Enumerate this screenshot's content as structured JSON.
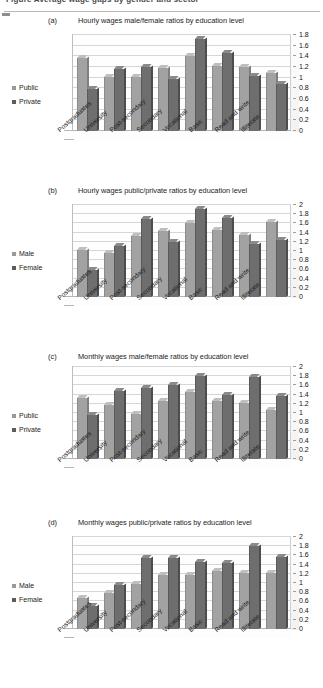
{
  "header": {
    "clipped_caption": "Figure  Average wage gaps by gender and sector"
  },
  "categories": [
    "Postgraduates",
    "University",
    "Post-secondary",
    "Secondary",
    "Vocational",
    "Basic",
    "Read and write",
    "Illiterate"
  ],
  "colors": {
    "series1": "#a2a2a2",
    "series2": "#6e6e6e",
    "gridline": "#d6d6d6",
    "axis": "#bdbdbd"
  },
  "panels": [
    {
      "letter": "(a)",
      "title": "Hourly wages male/female ratios by education level",
      "legend": [
        "Public",
        "Private"
      ],
      "yticks": [
        "1.8",
        "1.6",
        "1.4",
        "1.2",
        "1",
        "0.8",
        "0.6",
        "0.4",
        "0.2",
        "0"
      ]
    },
    {
      "letter": "(b)",
      "title": "Hourly wages public/private ratios by education level",
      "legend": [
        "Male",
        "Female"
      ],
      "yticks": [
        "2",
        "1.8",
        "1.6",
        "1.4",
        "1.2",
        "1",
        "0.8",
        "0.6",
        "0.4",
        "0.2",
        "0"
      ]
    },
    {
      "letter": "(c)",
      "title": "Monthly wages male/female ratios by education level",
      "legend": [
        "Public",
        "Private"
      ],
      "yticks": [
        "2",
        "1.8",
        "1.6",
        "1.4",
        "1.2",
        "1",
        "0.8",
        "0.6",
        "0.4",
        "0.2",
        "0"
      ]
    },
    {
      "letter": "(d)",
      "title": "Monthly wages public/private ratios by education level",
      "legend": [
        "Male",
        "Female"
      ],
      "yticks": [
        "2",
        "1.8",
        "1.6",
        "1.4",
        "1.2",
        "1",
        "0.8",
        "0.6",
        "0.4",
        "0.2",
        "0"
      ]
    }
  ],
  "chart_data": [
    {
      "type": "bar",
      "title": "Hourly wages male/female ratios by education level",
      "panel": "(a)",
      "xlabel": "",
      "ylabel": "",
      "ylim": [
        0,
        1.8
      ],
      "ytick_step": 0.2,
      "grid": true,
      "legend_position": "left",
      "categories": [
        "Postgraduates",
        "University",
        "Post-secondary",
        "Secondary",
        "Vocational",
        "Basic",
        "Read and write",
        "Illiterate"
      ],
      "series": [
        {
          "name": "Public",
          "values": [
            1.42,
            1.07,
            1.06,
            1.23,
            1.47,
            1.27,
            1.25,
            1.15
          ]
        },
        {
          "name": "Private",
          "values": [
            0.85,
            1.21,
            1.26,
            1.04,
            1.78,
            1.52,
            1.08,
            0.93
          ]
        }
      ]
    },
    {
      "type": "bar",
      "title": "Hourly wages public/private ratios by education level",
      "panel": "(b)",
      "xlabel": "",
      "ylabel": "",
      "ylim": [
        0,
        2.0
      ],
      "ytick_step": 0.2,
      "grid": true,
      "legend_position": "left",
      "categories": [
        "Postgraduates",
        "University",
        "Post-secondary",
        "Secondary",
        "Vocational",
        "Basic",
        "Read and write",
        "Illiterate"
      ],
      "series": [
        {
          "name": "Male",
          "values": [
            1.08,
            1.03,
            1.4,
            1.51,
            1.67,
            1.52,
            1.41,
            1.7
          ]
        },
        {
          "name": "Female",
          "values": [
            0.65,
            1.18,
            1.76,
            1.27,
            1.97,
            1.78,
            1.22,
            1.3
          ]
        }
      ]
    },
    {
      "type": "bar",
      "title": "Monthly wages male/female ratios by education level",
      "panel": "(c)",
      "xlabel": "",
      "ylabel": "",
      "ylim": [
        0,
        2.0
      ],
      "ytick_step": 0.2,
      "grid": true,
      "legend_position": "left",
      "categories": [
        "Postgraduates",
        "University",
        "Post-secondary",
        "Secondary",
        "Vocational",
        "Basic",
        "Read and write",
        "Illiterate"
      ],
      "series": [
        {
          "name": "Public",
          "values": [
            1.4,
            1.25,
            1.05,
            1.32,
            1.52,
            1.33,
            1.28,
            1.12
          ]
        },
        {
          "name": "Private",
          "values": [
            1.03,
            1.55,
            1.6,
            1.67,
            1.88,
            1.45,
            1.84,
            1.44
          ]
        }
      ]
    },
    {
      "type": "bar",
      "title": "Monthly wages public/private ratios by education level",
      "panel": "(d)",
      "xlabel": "",
      "ylabel": "",
      "ylim": [
        0,
        2.0
      ],
      "ytick_step": 0.2,
      "grid": true,
      "legend_position": "left",
      "categories": [
        "Postgraduates",
        "University",
        "Post-secondary",
        "Secondary",
        "Vocational",
        "Basic",
        "Read and write",
        "Illiterate"
      ],
      "series": [
        {
          "name": "Male",
          "values": [
            0.75,
            0.85,
            1.05,
            1.25,
            1.23,
            1.32,
            1.28,
            1.28
          ]
        },
        {
          "name": "Female",
          "values": [
            0.57,
            1.02,
            1.6,
            1.6,
            1.52,
            1.5,
            1.86,
            1.62
          ]
        }
      ]
    }
  ]
}
